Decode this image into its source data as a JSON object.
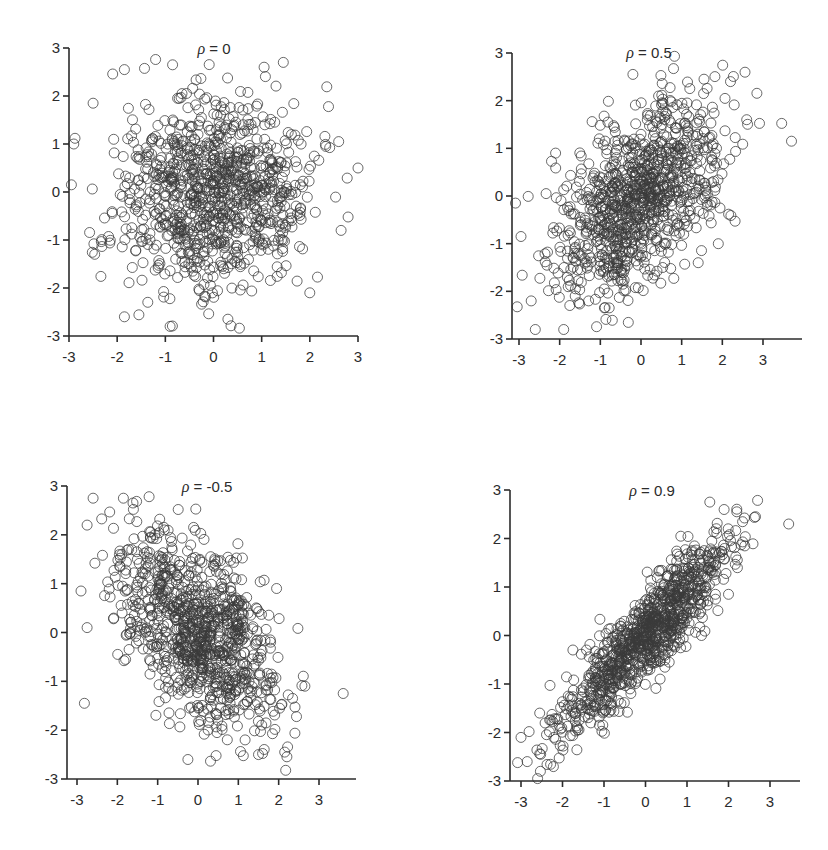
{
  "figure": {
    "layout": "2x2 grid of scatter plots",
    "marker": {
      "shape": "open-circle",
      "radius_px": 5,
      "color": "#3a3a3a"
    },
    "axis_color": "#2b2b2b"
  },
  "chart_data": [
    {
      "type": "scatter",
      "title": "ρ = 0",
      "title_symbol": "ρ",
      "title_value": "= 0",
      "correlation": 0,
      "n_points": 1000,
      "xlabel": "",
      "ylabel": "",
      "xlim": [
        -3,
        3
      ],
      "ylim": [
        -3,
        3
      ],
      "xticks": [
        -3,
        -2,
        -1,
        0,
        1,
        2,
        3
      ],
      "yticks": [
        -3,
        -2,
        -1,
        0,
        1,
        2,
        3
      ],
      "xtick_labels": [
        "-3",
        "-2",
        "-1",
        "0",
        "1",
        "2",
        "3"
      ],
      "ytick_labels": [
        "-3",
        "-2",
        "-1",
        "0",
        "1",
        "2",
        "3"
      ],
      "grid": false,
      "legend": null,
      "distribution": "bivariate standard normal, mean (0,0), sd (1,1)",
      "notable_points": [
        [
          -0.85,
          2.65
        ],
        [
          1.45,
          2.7
        ],
        [
          1.05,
          2.6
        ],
        [
          -1.85,
          2.55
        ],
        [
          -2.5,
          1.85
        ],
        [
          3.0,
          0.5
        ],
        [
          -2.95,
          0.15
        ],
        [
          2.65,
          -0.8
        ],
        [
          -1.85,
          -2.6
        ],
        [
          -0.9,
          -2.8
        ],
        [
          0.3,
          -2.65
        ],
        [
          2.0,
          -2.1
        ],
        [
          -2.9,
          1.0
        ],
        [
          2.6,
          1.05
        ]
      ],
      "pixel_frame": {
        "x_axis_px": [
          69,
          358
        ],
        "y_axis_px": [
          336,
          48
        ],
        "x_axis_end_px": 358
      }
    },
    {
      "type": "scatter",
      "title": "ρ = 0.5",
      "title_symbol": "ρ",
      "title_value": "= 0.5",
      "correlation": 0.5,
      "n_points": 1000,
      "xlabel": "",
      "ylabel": "",
      "xlim": [
        -3.2,
        3.8
      ],
      "ylim": [
        -3,
        3
      ],
      "xticks": [
        -3,
        -2,
        -1,
        0,
        1,
        2,
        3
      ],
      "yticks": [
        -3,
        -2,
        -1,
        0,
        1,
        2,
        3
      ],
      "xtick_labels": [
        "-3",
        "-2",
        "-1",
        "0",
        "1",
        "2",
        "3"
      ],
      "ytick_labels": [
        "-3",
        "-2",
        "-1",
        "0",
        "1",
        "2",
        "3"
      ],
      "grid": false,
      "legend": null,
      "distribution": "bivariate standard normal, corr 0.5",
      "notable_points": [
        [
          -0.2,
          2.55
        ],
        [
          3.7,
          1.15
        ],
        [
          -2.95,
          -0.85
        ],
        [
          -2.6,
          -2.8
        ],
        [
          -1.9,
          -2.8
        ],
        [
          -2.7,
          -2.2
        ],
        [
          1.9,
          -1.0
        ],
        [
          2.6,
          1.6
        ],
        [
          2.2,
          2.4
        ],
        [
          -2.1,
          0.9
        ],
        [
          1.55,
          2.45
        ]
      ],
      "pixel_frame": {
        "x_axis_px": [
          519,
          763
        ],
        "x_values_at": [
          -3,
          3
        ],
        "y_axis_px": [
          339,
          53
        ],
        "y_axis_x_px": 512,
        "x_axis_end_px": 802
      }
    },
    {
      "type": "scatter",
      "title": "ρ = -0.5",
      "title_symbol": "ρ",
      "title_value": "= -0.5",
      "correlation": -0.5,
      "n_points": 1000,
      "xlabel": "",
      "ylabel": "",
      "xlim": [
        -3.25,
        3.9
      ],
      "ylim": [
        -3,
        3
      ],
      "xticks": [
        -3,
        -2,
        -1,
        0,
        1,
        2,
        3
      ],
      "yticks": [
        -3,
        -2,
        -1,
        0,
        1,
        2,
        3
      ],
      "xtick_labels": [
        "-3",
        "-2",
        "-1",
        "0",
        "1",
        "2",
        "3"
      ],
      "ytick_labels": [
        "-3",
        "-2",
        "-1",
        "0",
        "1",
        "2",
        "3"
      ],
      "grid": false,
      "legend": null,
      "distribution": "bivariate standard normal, corr -0.5",
      "notable_points": [
        [
          -2.6,
          2.75
        ],
        [
          -1.85,
          2.75
        ],
        [
          -2.75,
          2.2
        ],
        [
          3.6,
          -1.25
        ],
        [
          -0.25,
          -2.6
        ],
        [
          1.5,
          -2.5
        ],
        [
          2.15,
          -2.45
        ],
        [
          -2.9,
          0.85
        ],
        [
          -2.75,
          0.1
        ],
        [
          1.95,
          0.9
        ],
        [
          2.65,
          -1.1
        ]
      ],
      "pixel_frame": {
        "x_axis_px": [
          77,
          319
        ],
        "x_values_at": [
          -3,
          3
        ],
        "y_axis_px": [
          779,
          486
        ],
        "y_axis_x_px": 67,
        "x_axis_end_px": 356
      }
    },
    {
      "type": "scatter",
      "title": "ρ = 0.9",
      "title_symbol": "ρ",
      "title_value": "= 0.9",
      "correlation": 0.9,
      "n_points": 1000,
      "xlabel": "",
      "ylabel": "",
      "xlim": [
        -3.25,
        3.7
      ],
      "ylim": [
        -3,
        3
      ],
      "xticks": [
        -3,
        -2,
        -1,
        0,
        1,
        2,
        3
      ],
      "yticks": [
        -3,
        -2,
        -1,
        0,
        1,
        2,
        3
      ],
      "xtick_labels": [
        "-3",
        "-2",
        "-1",
        "0",
        "1",
        "2",
        "3"
      ],
      "ytick_labels": [
        "-3",
        "-2",
        "-1",
        "0",
        "1",
        "2",
        "3"
      ],
      "grid": false,
      "legend": null,
      "distribution": "bivariate standard normal, corr 0.9",
      "notable_points": [
        [
          1.55,
          2.75
        ],
        [
          3.45,
          2.3
        ],
        [
          2.2,
          2.55
        ],
        [
          2.65,
          2.45
        ],
        [
          -3.0,
          -2.1
        ],
        [
          -2.6,
          -2.95
        ],
        [
          -2.85,
          -2.6
        ],
        [
          -2.55,
          -1.6
        ],
        [
          1.35,
          0.0
        ],
        [
          2.0,
          0.85
        ],
        [
          -1.75,
          -0.3
        ]
      ],
      "pixel_frame": {
        "x_axis_px": [
          521,
          770
        ],
        "x_values_at": [
          -3,
          3
        ],
        "y_axis_px": [
          781,
          490
        ],
        "y_axis_x_px": 510,
        "x_axis_end_px": 800
      }
    }
  ]
}
